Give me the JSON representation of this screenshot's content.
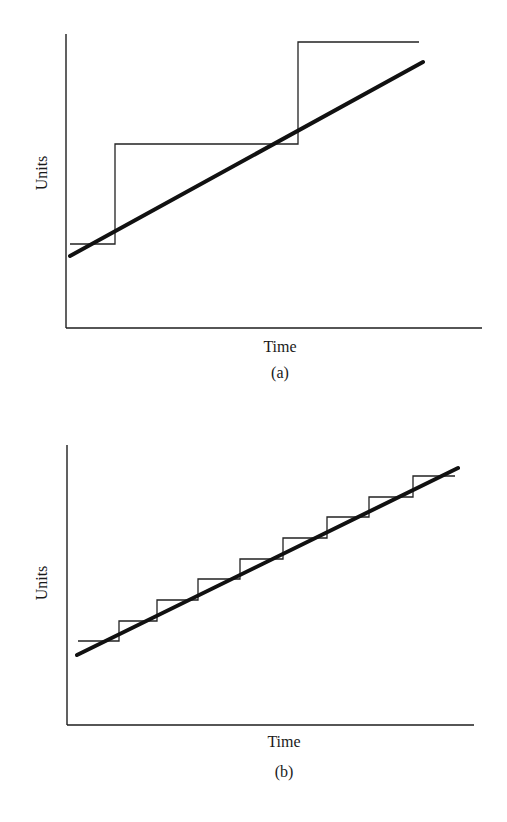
{
  "chart_data": [
    {
      "type": "line",
      "panel_label": "(a)",
      "xlabel": "Time",
      "ylabel": "Units",
      "grid": false,
      "ticks": false,
      "series": [
        {
          "name": "capacity (large steps)",
          "style": "thin step",
          "points": [
            [
              0.01,
              0.29
            ],
            [
              0.12,
              0.29
            ],
            [
              0.12,
              0.63
            ],
            [
              0.56,
              0.63
            ],
            [
              0.56,
              0.97
            ],
            [
              0.85,
              0.97
            ]
          ]
        },
        {
          "name": "demand trend",
          "style": "thick straight line",
          "points": [
            [
              0.01,
              0.25
            ],
            [
              0.86,
              0.9
            ]
          ]
        }
      ],
      "px": {
        "axis_origin": [
          66,
          328
        ],
        "y_top": 34,
        "x_right": 482,
        "step": [
          [
            70,
            244
          ],
          [
            115,
            244
          ],
          [
            115,
            144
          ],
          [
            298,
            144
          ],
          [
            298,
            42
          ],
          [
            419,
            42
          ]
        ],
        "trend": [
          [
            70,
            256
          ],
          [
            423,
            62
          ]
        ],
        "xlabel_pos": [
          280,
          352
        ],
        "ylabel_pos": [
          47,
          173
        ],
        "panel_pos": [
          280,
          378
        ]
      }
    },
    {
      "type": "line",
      "panel_label": "(b)",
      "xlabel": "Time",
      "ylabel": "Units",
      "grid": false,
      "ticks": false,
      "series": [
        {
          "name": "capacity (small steps)",
          "style": "thin step",
          "points": [
            [
              0.03,
              0.3
            ],
            [
              0.13,
              0.3
            ],
            [
              0.13,
              0.37
            ],
            [
              0.22,
              0.37
            ],
            [
              0.22,
              0.45
            ],
            [
              0.32,
              0.45
            ],
            [
              0.32,
              0.52
            ],
            [
              0.43,
              0.52
            ],
            [
              0.43,
              0.59
            ],
            [
              0.53,
              0.59
            ],
            [
              0.53,
              0.67
            ],
            [
              0.64,
              0.67
            ],
            [
              0.64,
              0.74
            ],
            [
              0.74,
              0.74
            ],
            [
              0.74,
              0.81
            ],
            [
              0.85,
              0.81
            ],
            [
              0.85,
              0.89
            ],
            [
              0.95,
              0.89
            ]
          ]
        },
        {
          "name": "demand trend",
          "style": "thick straight line",
          "points": [
            [
              0.02,
              0.25
            ],
            [
              0.96,
              0.92
            ]
          ]
        }
      ],
      "px": {
        "axis_origin": [
          67,
          725
        ],
        "y_top": 445,
        "x_right": 474,
        "step": [
          [
            78,
            641
          ],
          [
            119,
            641
          ],
          [
            119,
            621
          ],
          [
            157,
            621
          ],
          [
            157,
            600
          ],
          [
            198,
            600
          ],
          [
            198,
            579
          ],
          [
            240,
            579
          ],
          [
            240,
            559
          ],
          [
            283,
            559
          ],
          [
            283,
            538
          ],
          [
            327,
            538
          ],
          [
            327,
            517
          ],
          [
            369,
            517
          ],
          [
            369,
            497
          ],
          [
            413,
            497
          ],
          [
            413,
            476
          ],
          [
            455,
            476
          ]
        ],
        "trend": [
          [
            77,
            655
          ],
          [
            458,
            468
          ]
        ],
        "xlabel_pos": [
          284,
          747
        ],
        "ylabel_pos": [
          47,
          583
        ],
        "panel_pos": [
          284,
          777
        ]
      }
    }
  ]
}
